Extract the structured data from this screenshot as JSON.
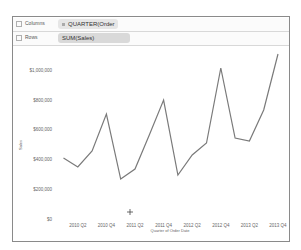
{
  "shelves": {
    "columns": {
      "label": "Columns",
      "pill": "QUARTER(Order ..."
    },
    "rows": {
      "label": "Rows",
      "pill": "SUM(Sales)"
    }
  },
  "chart_data": {
    "type": "line",
    "title": "",
    "xlabel": "Quarter of Order Date",
    "ylabel": "Sales",
    "ylim": [
      0,
      1200000
    ],
    "y_ticks": [
      "$0",
      "$200,000",
      "$400,000",
      "$600,000",
      "$800,000",
      "$1,000,000"
    ],
    "x_tick_labels": [
      "2010 Q2",
      "2010 Q4",
      "2011 Q2",
      "2011 Q4",
      "2012 Q2",
      "2012 Q4",
      "2013 Q2",
      "2013 Q4"
    ],
    "categories": [
      "2010 Q1",
      "2010 Q2",
      "2010 Q3",
      "2010 Q4",
      "2011 Q1",
      "2011 Q2",
      "2011 Q3",
      "2011 Q4",
      "2012 Q1",
      "2012 Q2",
      "2012 Q3",
      "2012 Q4",
      "2013 Q1",
      "2013 Q2",
      "2013 Q3",
      "2013 Q4"
    ],
    "series": [
      {
        "name": "SUM(Sales)",
        "color": "#7a7a7a",
        "values": [
          411000,
          350000,
          458000,
          707000,
          269000,
          337000,
          566000,
          801000,
          296000,
          431000,
          512000,
          1017000,
          545000,
          525000,
          734000,
          1111000
        ]
      }
    ],
    "grid": false
  }
}
